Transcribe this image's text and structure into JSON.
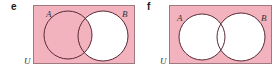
{
  "colors": {
    "shade": "#f2b3bf",
    "unshaded": "#ffffff",
    "circle_stroke": "#5a2a35",
    "rect_stroke": "#a07880"
  },
  "diagrams": [
    {
      "panel_label": "e",
      "universe_label": "U",
      "set_a_label": "A",
      "set_b_label": "B",
      "shaded_region": "A ∪ B'",
      "shading": {
        "outside": true,
        "a_only": true,
        "intersection": true,
        "b_only": false
      }
    },
    {
      "panel_label": "f",
      "universe_label": "U",
      "set_a_label": "A",
      "set_b_label": "B",
      "shaded_region": "(A ∪ B)'",
      "shading": {
        "outside": true,
        "a_only": false,
        "intersection": false,
        "b_only": false
      }
    }
  ]
}
